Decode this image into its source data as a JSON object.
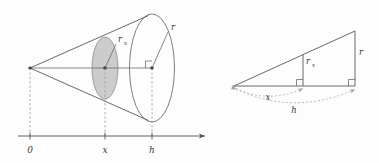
{
  "figure": {
    "background_color": "#fdfdfd",
    "stroke_color": "#585858",
    "shade_color": "#c9c9c9",
    "dash_color": "#9a9a9a"
  },
  "left_figure": {
    "name": "cone-with-cross-section",
    "apex_label": "0",
    "axis": {
      "ticks": [
        {
          "label": "0",
          "position": "apex"
        },
        {
          "label": "x",
          "position": "cross-section"
        },
        {
          "label": "h",
          "position": "base"
        }
      ],
      "arrow": "right"
    },
    "labels": {
      "cross_section_radius": "r",
      "cross_section_radius_sub": "x",
      "base_radius": "r"
    },
    "shaded_disk": {
      "name": "cross-section-disk",
      "fill": "#c9c9c9"
    }
  },
  "right_figure": {
    "name": "similar-triangles-side-view",
    "labels": {
      "inner_height": "r",
      "inner_height_sub": "x",
      "outer_height": "r",
      "arc_short": "x",
      "arc_long": "h"
    }
  }
}
